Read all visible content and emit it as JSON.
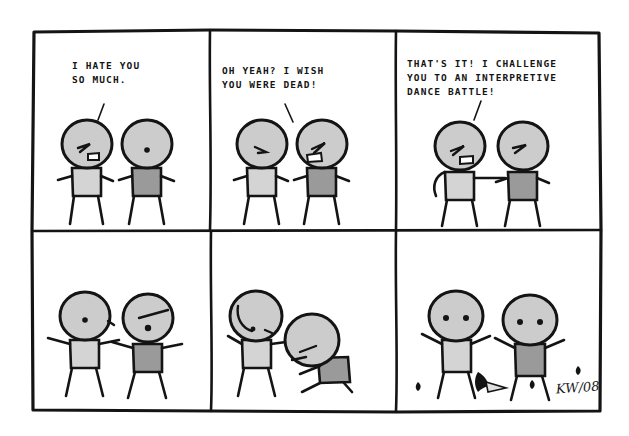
{
  "comic": {
    "title": "Interpretive Dance Battle",
    "artist_signature": "KW/08",
    "layout": {
      "columns": 3,
      "rows": 2,
      "panel_count": 6
    },
    "colors": {
      "ink": "#141414",
      "paper": "#ffffff",
      "head_fill": "#cccccc",
      "body_light": "#d4d4d4",
      "body_dark": "#9a9a9a",
      "prop_fill": "#e0e0e0"
    },
    "panels": [
      {
        "index": 1,
        "dialogue": "I HATE YOU\nSO MUCH.",
        "speaker": "left-figure",
        "tail_direction": "down-left",
        "description": "Two stick figures facing each other; left figure angry and shouting, right figure neutral.",
        "figures": [
          {
            "side": "left",
            "expression": "angry-shouting",
            "body_shade": "light",
            "pose": "standing"
          },
          {
            "side": "right",
            "expression": "neutral-dot",
            "body_shade": "dark",
            "pose": "standing"
          }
        ]
      },
      {
        "index": 2,
        "dialogue": "OH YEAH? I WISH\nYOU WERE DEAD!",
        "speaker": "right-figure",
        "tail_direction": "down-right",
        "description": "Right figure now angry and shouting back; left figure frowning.",
        "figures": [
          {
            "side": "left",
            "expression": "frowning",
            "body_shade": "light",
            "pose": "standing"
          },
          {
            "side": "right",
            "expression": "angry-shouting",
            "body_shade": "dark",
            "pose": "standing"
          }
        ]
      },
      {
        "index": 3,
        "dialogue": "THAT'S IT! I CHALLENGE\nYOU TO AN INTERPRETIVE\nDANCE BATTLE!",
        "speaker": "left-figure",
        "tail_direction": "down-left",
        "description": "Left figure declares the challenge with arm thrust forward; right figure glares.",
        "figures": [
          {
            "side": "left",
            "expression": "angry-shouting",
            "body_shade": "light",
            "pose": "arm-extended"
          },
          {
            "side": "right",
            "expression": "angry-eyes",
            "body_shade": "dark",
            "pose": "standing"
          }
        ]
      },
      {
        "index": 4,
        "dialogue": "",
        "speaker": "",
        "tail_direction": "none",
        "description": "Both figures begin dancing with arms flung out to the sides.",
        "figures": [
          {
            "side": "left",
            "expression": "neutral-dot",
            "body_shade": "light",
            "pose": "dancing-arms-out"
          },
          {
            "side": "right",
            "expression": "singing",
            "body_shade": "dark",
            "pose": "dancing-arms-out"
          }
        ]
      },
      {
        "index": 5,
        "dialogue": "",
        "speaker": "",
        "tail_direction": "none",
        "description": "Left figure leans into a dramatic pose; right figure crouches low to the ground.",
        "figures": [
          {
            "side": "left",
            "expression": "eyes-closed",
            "body_shade": "light",
            "pose": "leaning-dramatic"
          },
          {
            "side": "right",
            "expression": "eyes-closed",
            "body_shade": "dark",
            "pose": "crouching-low"
          }
        ]
      },
      {
        "index": 6,
        "dialogue": "",
        "speaker": "",
        "tail_direction": "none",
        "description": "Both figures stand triumphant with arms raised; a bird and scattered debris lie on the ground.",
        "figures": [
          {
            "side": "left",
            "expression": "two-dot-eyes",
            "body_shade": "light",
            "pose": "arms-raised-victory"
          },
          {
            "side": "right",
            "expression": "two-dot-eyes",
            "body_shade": "dark",
            "pose": "arms-raised-victory"
          }
        ],
        "props": [
          "bird",
          "debris-left",
          "debris-center",
          "debris-right",
          "debris-far-right"
        ]
      }
    ]
  }
}
